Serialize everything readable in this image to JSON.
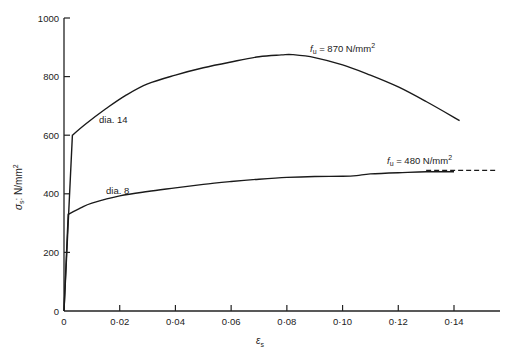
{
  "chart_data": {
    "type": "line",
    "title": "",
    "xlabel": "ε_s",
    "ylabel": "σ_s: N/mm²",
    "xlim": [
      0,
      0.155
    ],
    "ylim": [
      0,
      1000
    ],
    "grid": false,
    "legend": "none (curves labelled inline)",
    "x_ticks": [
      0,
      0.02,
      0.04,
      0.06,
      0.08,
      0.1,
      0.12,
      0.14
    ],
    "x_tick_labels": [
      "0",
      "0·02",
      "0·04",
      "0·06",
      "0·08",
      "0·10",
      "0·12",
      "0·14"
    ],
    "y_ticks": [
      0,
      200,
      400,
      600,
      800,
      1000
    ],
    "y_tick_labels": [
      "0",
      "200",
      "400",
      "600",
      "800",
      "1000"
    ],
    "series": [
      {
        "name": "dia. 14",
        "x": [
          0,
          0.003,
          0.008,
          0.015,
          0.022,
          0.03,
          0.04,
          0.05,
          0.06,
          0.07,
          0.078,
          0.082,
          0.09,
          0.1,
          0.11,
          0.12,
          0.13,
          0.142
        ],
        "y": [
          0,
          600,
          640,
          690,
          735,
          775,
          805,
          830,
          850,
          868,
          874,
          875,
          865,
          840,
          805,
          765,
          715,
          650
        ]
      },
      {
        "name": "dia. 8",
        "x": [
          0,
          0.0015,
          0.006,
          0.01,
          0.02,
          0.03,
          0.04,
          0.05,
          0.06,
          0.07,
          0.08,
          0.09,
          0.1,
          0.105,
          0.11,
          0.12,
          0.13,
          0.14
        ],
        "y": [
          0,
          330,
          352,
          368,
          393,
          408,
          420,
          432,
          442,
          450,
          456,
          459,
          460,
          462,
          468,
          472,
          475,
          475
        ]
      }
    ],
    "reference_lines": [
      {
        "name": "f_u = 480 N/mm² (dashed)",
        "y": 480,
        "x_start": 0.13,
        "x_end": 0.155,
        "style": "dashed"
      }
    ],
    "annotations": [
      {
        "text": "dia. 14",
        "x": 0.013,
        "y": 700
      },
      {
        "text": "dia. 8",
        "x": 0.016,
        "y": 400
      },
      {
        "text": "f_u = 870 N/mm²",
        "x": 0.087,
        "y": 885
      },
      {
        "text": "f_u = 480 N/mm²",
        "x": 0.116,
        "y": 500
      }
    ]
  },
  "labels": {
    "ylabel_sigma": "σ",
    "ylabel_sub": "s",
    "ylabel_unit": ": N/mm",
    "ylabel_sup": "2",
    "xlabel_eps": "ε",
    "xlabel_sub": "s",
    "series_dia14": "dia. 14",
    "series_dia8": "dia. 8",
    "fu870_f": "f",
    "fu870_sub": "u",
    "fu870_rest": " = 870 N/mm",
    "fu870_sup": "2",
    "fu480_f": "f",
    "fu480_sub": "u",
    "fu480_rest": " = 480 N/mm",
    "fu480_sup": "2"
  }
}
